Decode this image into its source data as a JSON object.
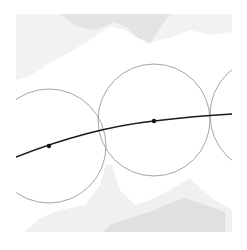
{
  "diagram": {
    "type": "geometric-figure",
    "background": "#ffffff",
    "clip": {
      "x": 16,
      "y": 12,
      "width": 216,
      "height": 220
    },
    "background_blobs": [
      {
        "id": "top-blob",
        "color": "#e8e8e8",
        "opacity": 0.55,
        "points": "16,14 232,14 232,32 210,35 190,30 170,38 152,42 138,38 125,30 110,26 90,40 70,52 48,64 30,76 16,80"
      },
      {
        "id": "top-blob-dark",
        "color": "#d4d4d4",
        "opacity": 0.5,
        "points": "60,14 170,14 160,28 150,44 138,38 128,28 115,22 95,30 75,26"
      },
      {
        "id": "bottom-blob",
        "color": "#e6e6e6",
        "opacity": 0.6,
        "points": "20,236 232,236 232,210 215,200 200,188 190,178 170,190 150,200 135,205 120,190 112,165 106,165 100,185 85,205 60,210 40,218"
      },
      {
        "id": "bottom-blob-dark",
        "color": "#cfcfcf",
        "opacity": 0.5,
        "points": "100,236 225,236 225,212 205,205 185,198 165,205 150,212 130,218 110,225"
      }
    ],
    "circles": [
      {
        "id": "circle-1",
        "cx": 49,
        "cy": 146,
        "r": 57,
        "stroke": "#9a9a9a"
      },
      {
        "id": "circle-2",
        "cx": 154,
        "cy": 120,
        "r": 56,
        "stroke": "#9a9a9a"
      },
      {
        "id": "circle-3",
        "cx": 268,
        "cy": 115,
        "r": 58,
        "stroke": "#9a9a9a"
      }
    ],
    "curve": {
      "id": "main-curve",
      "stroke": "#1a1a1a",
      "width": 1.6,
      "path": "M16,157 Q90,128 154,121 Q195,116 232,114"
    },
    "points": [
      {
        "id": "point-1",
        "x": 49,
        "y": 146,
        "r": 2.2,
        "fill": "#111111"
      },
      {
        "id": "point-2",
        "x": 154,
        "y": 121,
        "r": 2.2,
        "fill": "#111111"
      }
    ]
  }
}
